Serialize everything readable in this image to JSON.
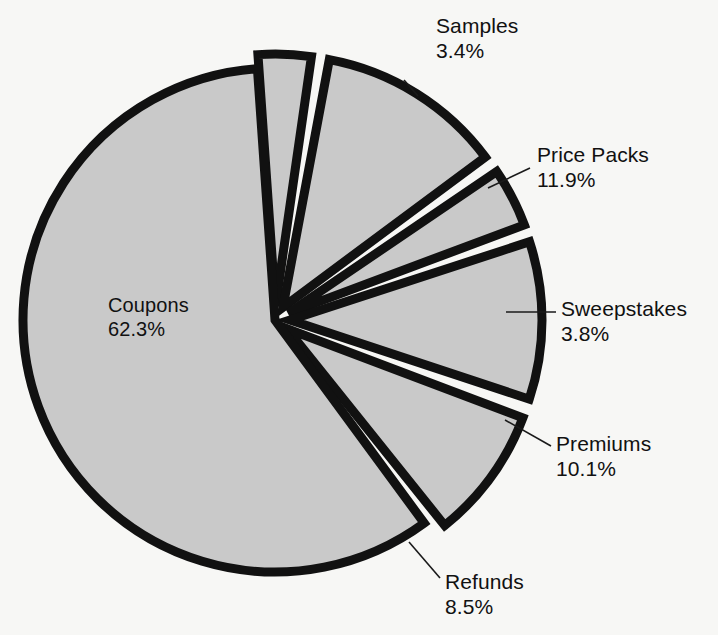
{
  "chart_data": {
    "type": "pie",
    "title": "",
    "subtitle": "",
    "xlabel": "",
    "ylabel": "",
    "legend_position": "none",
    "grid": false,
    "exploded": true,
    "units": "percent",
    "total": 100.0,
    "categories": [
      "Samples",
      "Price Packs",
      "Sweepstakes",
      "Premiums",
      "Refunds",
      "Coupons"
    ],
    "values": [
      3.4,
      11.9,
      3.8,
      10.1,
      8.5,
      62.3
    ],
    "slices": [
      {
        "label": "Samples",
        "percent_text": "3.4%",
        "value": 3.4,
        "start_angle_deg": -4.0,
        "end_angle_deg": 8.2,
        "explode": 14,
        "label_x": 436,
        "label_y": 14,
        "leader": "M 418,96 L 404,80"
      },
      {
        "label": "Price Packs",
        "percent_text": "11.9%",
        "value": 11.9,
        "start_angle_deg": 10.6,
        "end_angle_deg": 53.4,
        "explode": 15,
        "label_x": 537,
        "label_y": 143,
        "leader": "M 530,168 L 488,188"
      },
      {
        "label": "Sweepstakes",
        "percent_text": "3.8%",
        "value": 3.8,
        "start_angle_deg": 55.8,
        "end_angle_deg": 69.5,
        "explode": 15,
        "label_x": 561,
        "label_y": 297,
        "leader": "M 556,312 L 506,312"
      },
      {
        "label": "Premiums",
        "percent_text": "10.1%",
        "value": 10.1,
        "start_angle_deg": 71.9,
        "end_angle_deg": 108.3,
        "explode": 15,
        "label_x": 556,
        "label_y": 432,
        "leader": "M 551,446 L 505,420"
      },
      {
        "label": "Refunds",
        "percent_text": "8.5%",
        "value": 8.5,
        "start_angle_deg": 110.7,
        "end_angle_deg": 141.3,
        "explode": 15,
        "label_x": 445,
        "label_y": 570,
        "leader": "M 440,578 L 409,542"
      },
      {
        "label": "Coupons",
        "percent_text": "62.3%",
        "value": 62.3,
        "start_angle_deg": 143.7,
        "end_angle_deg": 356.0,
        "explode": 0,
        "label_x": 108,
        "label_y": 294,
        "leader": ""
      }
    ],
    "geometry": {
      "center_x": 275,
      "center_y": 320,
      "radius": 252,
      "stroke_width": 9
    },
    "colors": {
      "background": "#f7f7f5",
      "slice_fill": "#c9c9c9",
      "slice_stroke": "#111111",
      "text": "#111111"
    }
  }
}
